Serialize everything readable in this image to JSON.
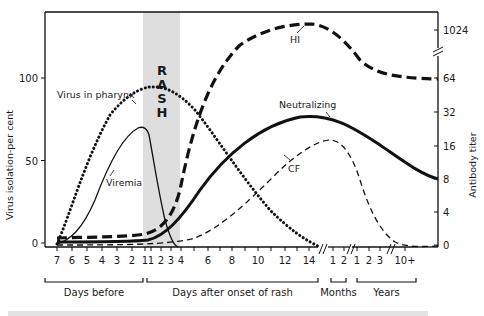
{
  "chart_data": {
    "type": "line",
    "title": "",
    "left_axis": {
      "label": "Virus isolation-per cent",
      "ticks": [
        0,
        50,
        100
      ],
      "range": [
        0,
        130
      ]
    },
    "right_axis": {
      "label": "Antibody titer",
      "ticks": [
        "0",
        "4",
        "8",
        "16",
        "32",
        "64",
        "1024"
      ],
      "scale": "log2 with axis break between 64 and 1024"
    },
    "x_axis": {
      "segments": [
        {
          "name": "Days before",
          "ticks": [
            "7",
            "6",
            "5",
            "4",
            "3",
            "2",
            "1"
          ]
        },
        {
          "name": "Days after onset of rash",
          "ticks": [
            "1",
            "2",
            "3",
            "4",
            "6",
            "8",
            "10",
            "12",
            "14"
          ]
        },
        {
          "name": "Months",
          "ticks": [
            "1",
            "2"
          ]
        },
        {
          "name": "Years",
          "ticks": [
            "1",
            "2",
            "3",
            "10+"
          ]
        }
      ]
    },
    "shaded_band": {
      "label_letters": [
        "R",
        "A",
        "S",
        "H"
      ],
      "from": "day before 1",
      "to": "day after 3"
    },
    "series": [
      {
        "name": "Virus in pharynx",
        "style": "dotted",
        "axis": "left",
        "points": [
          [
            "b7",
            0
          ],
          [
            "b6",
            10
          ],
          [
            "b5",
            35
          ],
          [
            "b4",
            58
          ],
          [
            "b3",
            74
          ],
          [
            "b2",
            84
          ],
          [
            "b1",
            88
          ],
          [
            "a2",
            89
          ],
          [
            "a4",
            84
          ],
          [
            "a6",
            70
          ],
          [
            "a8",
            52
          ],
          [
            "a10",
            32
          ],
          [
            "a12",
            15
          ],
          [
            "a14",
            3
          ]
        ]
      },
      {
        "name": "Viremia",
        "style": "solid-thin",
        "axis": "left",
        "points": [
          [
            "b7",
            0
          ],
          [
            "b6",
            5
          ],
          [
            "b5",
            15
          ],
          [
            "b4",
            32
          ],
          [
            "b3",
            50
          ],
          [
            "b2",
            63
          ],
          [
            "b1",
            70
          ],
          [
            "a1",
            68
          ],
          [
            "a2",
            35
          ],
          [
            "a3",
            10
          ],
          [
            "a4",
            0
          ]
        ]
      },
      {
        "name": "HI",
        "style": "dashed-thick",
        "axis": "right",
        "points": [
          [
            "b7",
            "0+"
          ],
          [
            "b1",
            "0+"
          ],
          [
            "a2",
            "2"
          ],
          [
            "a4",
            "16"
          ],
          [
            "a6",
            "128"
          ],
          [
            "a8",
            "512"
          ],
          [
            "a12",
            "1024"
          ],
          [
            "a14",
            "1024"
          ],
          [
            "m1",
            "512"
          ],
          [
            "y1",
            "128"
          ],
          [
            "y3",
            "64"
          ],
          [
            "y10+",
            "64"
          ]
        ]
      },
      {
        "name": "Neutralizing",
        "style": "solid-thick",
        "axis": "right",
        "points": [
          [
            "b7",
            "0"
          ],
          [
            "b1",
            "0+"
          ],
          [
            "a2",
            "1"
          ],
          [
            "a4",
            "4"
          ],
          [
            "a6",
            "12"
          ],
          [
            "a8",
            "22"
          ],
          [
            "a12",
            "28"
          ],
          [
            "a14",
            "28"
          ],
          [
            "m1",
            "24"
          ],
          [
            "y2",
            "14"
          ],
          [
            "y10+",
            "8"
          ]
        ]
      },
      {
        "name": "CF",
        "style": "dashed-thin",
        "axis": "right",
        "points": [
          [
            "b7",
            "0"
          ],
          [
            "a3",
            "0"
          ],
          [
            "a6",
            "2"
          ],
          [
            "a10",
            "8"
          ],
          [
            "a14",
            "16"
          ],
          [
            "m1",
            "18"
          ],
          [
            "m2",
            "12"
          ],
          [
            "y2",
            "2"
          ],
          [
            "y3",
            "0"
          ],
          [
            "y10+",
            "0"
          ]
        ]
      }
    ],
    "annotations": [
      "Virus in pharynx",
      "Viremia",
      "HI",
      "Neutralizing",
      "CF"
    ],
    "grid": false,
    "legend": "none (inline labels)"
  },
  "caption_partial": "(caption cut off, illegible)"
}
